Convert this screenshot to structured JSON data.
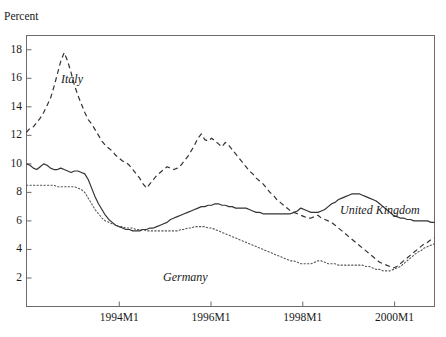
{
  "figure": {
    "clipped_header": "",
    "axis_label_y": "Percent"
  },
  "axes": {
    "y_ticks": [
      "18",
      "16",
      "14",
      "12",
      "10",
      "8",
      "6",
      "4",
      "2"
    ],
    "x_ticks": [
      "1994M1",
      "1996M1",
      "1998M1",
      "2000M1"
    ]
  },
  "labels": {
    "italy": "Italy",
    "united_kingdom": "United Kingdom",
    "germany": "Germany"
  },
  "chart_data": {
    "type": "line",
    "title": "",
    "xlabel": "",
    "ylabel": "Percent",
    "ylim": [
      0,
      19
    ],
    "grid": false,
    "legend_position": "inline-annotations",
    "x_tick_labels": [
      "1994M1",
      "1996M1",
      "1998M1",
      "2000M1"
    ],
    "x_tick_fractions": [
      0.2274,
      0.4523,
      0.6772,
      0.9022
    ],
    "x_range_description": "monthly, approx 1992M1 through 2000M12",
    "series": [
      {
        "name": "Italy",
        "style": "dashed",
        "color": "#333333",
        "values": [
          12.2,
          12.5,
          12.6,
          12.9,
          13.2,
          13.6,
          14.1,
          14.6,
          15.4,
          16.3,
          17.2,
          17.8,
          17.2,
          16.4,
          15.5,
          14.8,
          14.2,
          13.6,
          13.1,
          12.8,
          12.4,
          12.0,
          11.6,
          11.3,
          11.1,
          10.9,
          10.6,
          10.4,
          10.2,
          10.1,
          9.9,
          9.6,
          9.3,
          9.0,
          8.6,
          8.3,
          8.6,
          8.9,
          9.2,
          9.4,
          9.6,
          9.8,
          9.7,
          9.6,
          9.7,
          9.9,
          10.2,
          10.5,
          10.9,
          11.3,
          11.8,
          12.1,
          11.7,
          11.6,
          11.8,
          11.6,
          11.4,
          11.2,
          11.5,
          11.3,
          11.0,
          10.7,
          10.4,
          10.1,
          9.8,
          9.5,
          9.3,
          9.0,
          8.8,
          8.6,
          8.3,
          8.0,
          7.8,
          7.5,
          7.3,
          7.1,
          6.9,
          6.7,
          6.6,
          6.5,
          6.4,
          6.3,
          6.2,
          6.2,
          6.3,
          6.4,
          6.2,
          6.1,
          6.0,
          5.9,
          5.7,
          5.5,
          5.3,
          5.1,
          4.9,
          4.7,
          4.5,
          4.3,
          4.1,
          3.9,
          3.7,
          3.5,
          3.3,
          3.1,
          3.0,
          2.9,
          2.8,
          2.7,
          2.8,
          3.0,
          3.2,
          3.4,
          3.6,
          3.8,
          4.0,
          4.2,
          4.4,
          4.5,
          4.7,
          4.8
        ]
      },
      {
        "name": "United Kingdom",
        "style": "solid",
        "color": "#333333",
        "values": [
          10.0,
          9.9,
          9.7,
          9.6,
          9.8,
          10.0,
          9.9,
          9.7,
          9.6,
          9.6,
          9.7,
          9.6,
          9.5,
          9.4,
          9.5,
          9.5,
          9.4,
          9.3,
          8.9,
          8.3,
          7.7,
          7.2,
          6.8,
          6.4,
          6.1,
          5.9,
          5.7,
          5.6,
          5.5,
          5.4,
          5.4,
          5.3,
          5.3,
          5.3,
          5.4,
          5.4,
          5.5,
          5.5,
          5.6,
          5.7,
          5.8,
          5.9,
          6.1,
          6.2,
          6.3,
          6.4,
          6.5,
          6.6,
          6.7,
          6.8,
          6.9,
          7.0,
          7.0,
          7.1,
          7.1,
          7.2,
          7.2,
          7.1,
          7.1,
          7.0,
          7.0,
          6.9,
          6.9,
          6.9,
          6.9,
          6.8,
          6.7,
          6.6,
          6.6,
          6.5,
          6.5,
          6.5,
          6.5,
          6.5,
          6.5,
          6.5,
          6.5,
          6.5,
          6.6,
          6.7,
          6.9,
          6.8,
          6.7,
          6.6,
          6.6,
          6.6,
          6.7,
          6.8,
          7.0,
          7.2,
          7.3,
          7.5,
          7.6,
          7.7,
          7.8,
          7.9,
          7.9,
          7.9,
          7.8,
          7.7,
          7.6,
          7.5,
          7.4,
          7.2,
          7.0,
          6.8,
          6.6,
          6.4,
          6.3,
          6.2,
          6.2,
          6.1,
          6.1,
          6.0,
          6.0,
          6.0,
          6.0,
          6.0,
          5.9,
          5.9
        ]
      },
      {
        "name": "Germany",
        "style": "dotted",
        "color": "#555555",
        "values": [
          8.5,
          8.5,
          8.5,
          8.5,
          8.5,
          8.5,
          8.5,
          8.5,
          8.5,
          8.4,
          8.4,
          8.4,
          8.4,
          8.4,
          8.4,
          8.3,
          8.2,
          8.0,
          7.6,
          7.2,
          6.8,
          6.5,
          6.2,
          6.0,
          5.9,
          5.8,
          5.7,
          5.6,
          5.6,
          5.5,
          5.5,
          5.5,
          5.4,
          5.4,
          5.4,
          5.3,
          5.3,
          5.3,
          5.3,
          5.3,
          5.3,
          5.3,
          5.3,
          5.3,
          5.3,
          5.4,
          5.4,
          5.5,
          5.5,
          5.6,
          5.6,
          5.6,
          5.6,
          5.5,
          5.5,
          5.4,
          5.3,
          5.2,
          5.1,
          5.0,
          4.9,
          4.8,
          4.7,
          4.6,
          4.5,
          4.4,
          4.3,
          4.2,
          4.1,
          4.0,
          3.9,
          3.8,
          3.7,
          3.6,
          3.5,
          3.4,
          3.3,
          3.2,
          3.2,
          3.1,
          3.0,
          3.0,
          3.0,
          3.0,
          3.1,
          3.2,
          3.2,
          3.1,
          3.0,
          3.0,
          3.0,
          2.9,
          2.9,
          2.9,
          2.9,
          2.9,
          2.9,
          2.9,
          2.9,
          2.8,
          2.8,
          2.7,
          2.6,
          2.6,
          2.5,
          2.5,
          2.5,
          2.6,
          2.7,
          2.8,
          3.0,
          3.2,
          3.4,
          3.6,
          3.8,
          3.9,
          4.1,
          4.2,
          4.3,
          4.4
        ]
      }
    ]
  }
}
